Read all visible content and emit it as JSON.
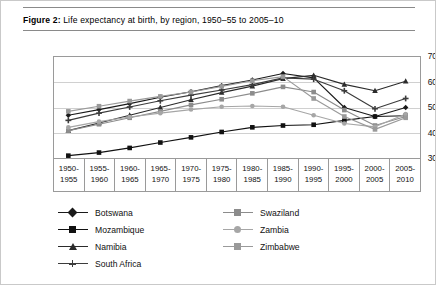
{
  "caption": {
    "figure_number": "Figure 2:",
    "text": " Life expectancy at birth, by region, 1950–55 to 2005–10"
  },
  "chart_data": {
    "type": "line",
    "title": "Life expectancy at birth, by region, 1950–55 to 2005–10",
    "xlabel": "",
    "ylabel": "Years",
    "ylim": [
      30,
      70
    ],
    "yticks": [
      30,
      40,
      50,
      60,
      70
    ],
    "grid": true,
    "legend_position": "bottom",
    "categories": [
      "1950-1955",
      "1955-1960",
      "1960-1965",
      "1965-1970",
      "1970-1975",
      "1975-1980",
      "1980-1985",
      "1985-1990",
      "1990-1995",
      "1995-2000",
      "2000-2005",
      "2005-2010"
    ],
    "series": [
      {
        "name": "Botswana",
        "marker": "diamond",
        "color": "#1a1a1a",
        "values": [
          47.0,
          49.2,
          51.5,
          54.0,
          56.1,
          58.5,
          60.7,
          63.2,
          61.5,
          50.0,
          46.5,
          50.0
        ]
      },
      {
        "name": "Mozambique",
        "marker": "square",
        "color": "#111111",
        "values": [
          31.3,
          32.5,
          34.3,
          36.4,
          38.4,
          40.5,
          42.3,
          43.0,
          43.3,
          45.0,
          46.5,
          46.8
        ]
      },
      {
        "name": "Namibia",
        "marker": "triangle",
        "color": "#2b2b2b",
        "values": [
          41.0,
          44.0,
          47.0,
          50.0,
          53.0,
          55.8,
          58.3,
          61.2,
          62.5,
          59.0,
          56.5,
          60.2
        ]
      },
      {
        "name": "South Africa",
        "marker": "x",
        "color": "#3c3c3c",
        "values": [
          45.0,
          47.8,
          50.2,
          52.6,
          54.8,
          56.8,
          58.9,
          61.5,
          61.0,
          56.5,
          49.5,
          53.5
        ]
      },
      {
        "name": "Swaziland",
        "marker": "square",
        "color": "#8c8c8c",
        "values": [
          41.0,
          43.5,
          46.0,
          48.5,
          51.0,
          53.2,
          55.5,
          58.0,
          56.0,
          49.0,
          43.0,
          46.5
        ]
      },
      {
        "name": "Zambia",
        "marker": "circle",
        "color": "#a6a6a6",
        "values": [
          42.3,
          44.5,
          46.3,
          47.8,
          49.2,
          50.3,
          50.6,
          50.3,
          47.0,
          43.8,
          42.5,
          47.5
        ]
      },
      {
        "name": "Zimbabwe",
        "marker": "square",
        "color": "#9a9a9a",
        "values": [
          48.5,
          50.5,
          52.5,
          54.3,
          56.0,
          58.2,
          60.4,
          62.0,
          53.5,
          46.5,
          41.5,
          46.0
        ]
      }
    ]
  },
  "yaxis": {
    "title": "Years",
    "ticks": [
      "70",
      "60",
      "50",
      "40",
      "30"
    ]
  },
  "xaxis": {
    "cells": [
      {
        "top": "1950-",
        "bottom": "1955"
      },
      {
        "top": "1955-",
        "bottom": "1960"
      },
      {
        "top": "1960-",
        "bottom": "1965"
      },
      {
        "top": "1965-",
        "bottom": "1970"
      },
      {
        "top": "1970-",
        "bottom": "1975"
      },
      {
        "top": "1975-",
        "bottom": "1980"
      },
      {
        "top": "1980-",
        "bottom": "1985"
      },
      {
        "top": "1985-",
        "bottom": "1990"
      },
      {
        "top": "1990-",
        "bottom": "1995"
      },
      {
        "top": "1995-",
        "bottom": "2000"
      },
      {
        "top": "2000-",
        "bottom": "2005"
      },
      {
        "top": "2005-",
        "bottom": "2010"
      }
    ]
  },
  "legend": {
    "column_left": [
      {
        "label": "Botswana",
        "marker": "diamond",
        "color": "#1a1a1a"
      },
      {
        "label": "Mozambique",
        "marker": "square",
        "color": "#111111"
      },
      {
        "label": "Namibia",
        "marker": "triangle",
        "color": "#2b2b2b"
      },
      {
        "label": "South Africa",
        "marker": "x",
        "color": "#3c3c3c"
      }
    ],
    "column_right": [
      {
        "label": "Swaziland",
        "marker": "square",
        "color": "#8c8c8c"
      },
      {
        "label": "Zambia",
        "marker": "circle",
        "color": "#a6a6a6"
      },
      {
        "label": "Zimbabwe",
        "marker": "square",
        "color": "#9a9a9a"
      }
    ]
  }
}
